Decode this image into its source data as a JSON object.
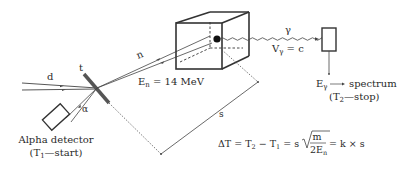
{
  "diagram": {
    "type": "associated-particle-technique",
    "labels": {
      "deuteron": "d",
      "target": "t",
      "neutron": "n",
      "neutron_energy_main": "E",
      "neutron_energy_sub": "n",
      "neutron_energy_value": " = 14 MeV",
      "gamma": "γ",
      "gamma_velocity_main": "V",
      "gamma_velocity_sub": "γ",
      "gamma_velocity_value": " = c",
      "gamma_energy_main": "E",
      "gamma_energy_sub": "γ",
      "spectrum": "spectrum",
      "stop_open": "(T",
      "stop_sub": "2",
      "stop_close": "—stop)",
      "alpha": "α",
      "alpha_detector": "Alpha detector",
      "start_open": "(T",
      "start_sub": "1",
      "start_close": "—start)",
      "distance": "s"
    },
    "equation": {
      "lhs": "ΔT = T",
      "t2_sub": "2",
      "minus": " − T",
      "t1_sub": "1",
      "eq_s": " = s",
      "numerator": "m",
      "denominator_main": "2E",
      "denominator_sub": "n",
      "rhs": " = k × s"
    },
    "colors": {
      "line": "#444444",
      "text": "#2a2a2a",
      "target": "#555555",
      "dot": "#111111"
    }
  }
}
